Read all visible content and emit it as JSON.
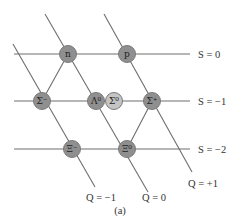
{
  "diagram": {
    "caption": "(a)",
    "colors": {
      "node_fill": "#8f8f8f",
      "node_fill_light": "#c4c4c4",
      "line": "#6e6e6e"
    },
    "strangeness_labels": [
      {
        "text": "S = 0",
        "x": 198,
        "y": 58
      },
      {
        "text": "S = −1",
        "x": 198,
        "y": 105
      },
      {
        "text": "S = −2",
        "x": 198,
        "y": 153
      }
    ],
    "charge_labels": [
      {
        "text": "Q = −1",
        "x": 86,
        "y": 201
      },
      {
        "text": "Q = 0",
        "x": 142,
        "y": 201
      },
      {
        "text": "Q = +1",
        "x": 188,
        "y": 187
      }
    ],
    "particles": [
      {
        "name": "n",
        "symbol": "n",
        "x": 68,
        "y": 54,
        "light": false
      },
      {
        "name": "p",
        "symbol": "p",
        "x": 127,
        "y": 54,
        "light": false
      },
      {
        "name": "sigma-minus",
        "symbol": "Σ⁻",
        "x": 42,
        "y": 101,
        "light": false
      },
      {
        "name": "lambda-zero",
        "symbol": "Λ⁰",
        "x": 96,
        "y": 101,
        "light": false
      },
      {
        "name": "sigma-zero",
        "symbol": "Σ⁰",
        "x": 114,
        "y": 101,
        "light": true
      },
      {
        "name": "sigma-plus",
        "symbol": "Σ⁺",
        "x": 152,
        "y": 101,
        "light": false
      },
      {
        "name": "xi-minus",
        "symbol": "Ξ⁻",
        "x": 72,
        "y": 149,
        "light": false
      },
      {
        "name": "xi-zero",
        "symbol": "Ξ⁰",
        "x": 127,
        "y": 149,
        "light": false
      }
    ]
  }
}
